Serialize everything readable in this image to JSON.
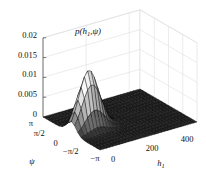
{
  "figure": {
    "background": "#ffffff",
    "title": {
      "text": "p(h1,ψ)",
      "pre": "p(h",
      "sub": "1",
      "post": ",ψ)"
    }
  },
  "chart_data": {
    "type": "3d-surface-mesh",
    "title": "p(h1,ψ)",
    "legend": "none",
    "grid": "on",
    "x_axis": {
      "label": "h1",
      "label_base": "h",
      "label_sub": "1",
      "range": [
        0,
        450
      ],
      "ticks": [
        {
          "label": "0",
          "value": 0
        },
        {
          "label": "200",
          "value": 200
        },
        {
          "label": "400",
          "value": 400
        }
      ]
    },
    "y_axis": {
      "label": "ψ",
      "range": [
        -3.14159265,
        3.14159265
      ],
      "ticks": [
        {
          "label": "π",
          "value": 3.14159265
        },
        {
          "label": "π/2",
          "value": 1.57079633
        },
        {
          "label": "0",
          "value": 0
        },
        {
          "label": "−π/2",
          "value": -1.57079633
        },
        {
          "label": "−π",
          "value": -3.14159265
        }
      ]
    },
    "z_axis": {
      "range": [
        0,
        0.02
      ],
      "ticks": [
        {
          "label": "0",
          "value": 0
        },
        {
          "label": "0.005",
          "value": 0.005
        },
        {
          "label": "0.01",
          "value": 0.01
        },
        {
          "label": "0.015",
          "value": 0.015
        },
        {
          "label": "0.02",
          "value": 0.02
        }
      ]
    },
    "surface": {
      "model": "gaussian-peak",
      "peak_value": 0.0147,
      "h1_mean": 80,
      "h1_sigma": 45,
      "psi_mean": 0,
      "psi_sigma": 0.5,
      "baseline": 0,
      "grid_cells": {
        "h1": 30,
        "psi": 18
      }
    },
    "colors": {
      "floor_facet": "#212121",
      "mesh_edge": "#000000",
      "peak_facet": "#ffffff",
      "wall_gridline": "#dfdfdf",
      "wall_fill": "#ffffff",
      "axis_line": "#555555",
      "text": "#111111"
    }
  }
}
